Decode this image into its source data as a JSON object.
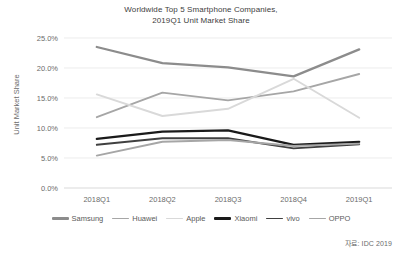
{
  "chart_data": {
    "type": "line",
    "title": "Worldwide Top 5 Smartphone Companies, 2019Q1 Unit Market Share",
    "title_line1": "Worldwide Top 5 Smartphone Companies,",
    "title_line2": "2019Q1 Unit Market Share",
    "xlabel": "",
    "ylabel": "Unit Market Share",
    "categories": [
      "2018Q1",
      "2018Q2",
      "2018Q3",
      "2018Q4",
      "2019Q1"
    ],
    "ylim": [
      0,
      25
    ],
    "ytick_labels": [
      "0.0%",
      "5.0%",
      "10.0%",
      "15.0%",
      "20.0%",
      "25.0%"
    ],
    "ytick_values": [
      0,
      5,
      10,
      15,
      20,
      25
    ],
    "grid": true,
    "legend_position": "bottom",
    "series": [
      {
        "name": "Samsung",
        "color": "#8c8c8c",
        "width": 2.3,
        "values": [
          23.5,
          20.8,
          20.1,
          18.6,
          23.1
        ]
      },
      {
        "name": "Huawei",
        "color": "#a6a6a6",
        "width": 1.9,
        "values": [
          11.8,
          15.9,
          14.6,
          16.1,
          19.0
        ]
      },
      {
        "name": "Apple",
        "color": "#d9d9d9",
        "width": 1.9,
        "values": [
          15.6,
          12.0,
          13.2,
          18.2,
          11.7
        ]
      },
      {
        "name": "Xiaomi",
        "color": "#1a1a1a",
        "width": 2.3,
        "values": [
          8.2,
          9.4,
          9.6,
          7.2,
          7.7
        ]
      },
      {
        "name": "vivo",
        "color": "#404040",
        "width": 1.9,
        "values": [
          7.2,
          8.3,
          8.3,
          6.6,
          7.3
        ]
      },
      {
        "name": "OPPO",
        "color": "#a6a6a6",
        "width": 1.9,
        "values": [
          5.4,
          7.7,
          8.0,
          7.0,
          7.4
        ]
      }
    ]
  },
  "source_note": "자료: IDC 2019"
}
